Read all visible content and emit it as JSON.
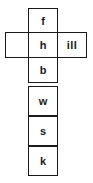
{
  "figure": {
    "name": "cross-shaped-letter-grid",
    "background_color": "#ffffff",
    "border_color": "#1a1a1a",
    "text_color": "#1a1a1a",
    "cell_width": 30,
    "cell_height": 27
  },
  "grid": {
    "column": {
      "name": "vertical-column",
      "cells": [
        {
          "id": "col-0",
          "label": "f",
          "x": 28,
          "y": 8,
          "w": 30,
          "h": 26
        },
        {
          "id": "col-1",
          "label": "h",
          "x": 28,
          "y": 32,
          "w": 30,
          "h": 26
        },
        {
          "id": "col-2",
          "label": "b",
          "x": 28,
          "y": 57,
          "w": 30,
          "h": 26
        },
        {
          "id": "col-3",
          "label": "w",
          "x": 28,
          "y": 86,
          "w": 30,
          "h": 30
        },
        {
          "id": "col-4",
          "label": "s",
          "x": 28,
          "y": 116,
          "w": 30,
          "h": 30
        },
        {
          "id": "col-5",
          "label": "k",
          "x": 28,
          "y": 146,
          "w": 30,
          "h": 30
        }
      ]
    },
    "row": {
      "name": "horizontal-row",
      "cells": [
        {
          "id": "row-left",
          "label": "",
          "x": 5,
          "y": 32,
          "w": 24,
          "h": 26
        },
        {
          "id": "row-center",
          "label": "h",
          "x": 28,
          "y": 32,
          "w": 30,
          "h": 26
        },
        {
          "id": "row-right",
          "label": "ill",
          "x": 57,
          "y": 32,
          "w": 30,
          "h": 26
        }
      ]
    }
  }
}
